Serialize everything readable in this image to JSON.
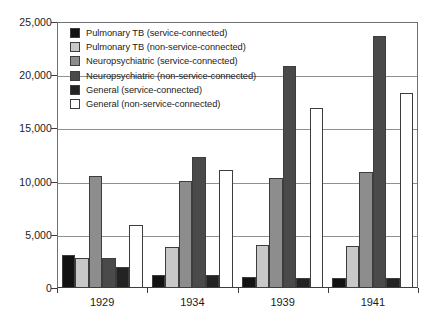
{
  "chart_data": {
    "type": "bar",
    "title": "",
    "subtitle": "",
    "xlabel": "",
    "ylabel": "",
    "categories": [
      "1929",
      "1934",
      "1939",
      "1941"
    ],
    "ylim": [
      0,
      25000
    ],
    "ytick_labels": [
      "0",
      "5,000",
      "10,000",
      "15,000",
      "20,000",
      "25,000"
    ],
    "ytick_values": [
      0,
      5000,
      10000,
      15000,
      20000,
      25000
    ],
    "grid": true,
    "legend_position": "upper-left-inside",
    "series": [
      {
        "name": "Pulmonary TB (service-connected)",
        "color": "#121212",
        "values": [
          3100,
          1250,
          1000,
          900
        ]
      },
      {
        "name": "Pulmonary TB (non-service-connected)",
        "color": "#c8c8c8",
        "values": [
          2850,
          3850,
          4050,
          3950
        ]
      },
      {
        "name": "Neuropsychiatric (service-connected)",
        "color": "#8d8d8d",
        "values": [
          10500,
          10050,
          10350,
          10950
        ]
      },
      {
        "name": "Neuropsychiatric (non-service-connected)",
        "color": "#4a4a4a",
        "values": [
          2850,
          12300,
          20900,
          23700
        ]
      },
      {
        "name": "General (service-connected)",
        "color": "#232323",
        "values": [
          1950,
          1200,
          950,
          900
        ]
      },
      {
        "name": "General (non-service-connected)",
        "color": "#ffffff",
        "values": [
          5900,
          11050,
          16900,
          18350
        ]
      }
    ]
  }
}
